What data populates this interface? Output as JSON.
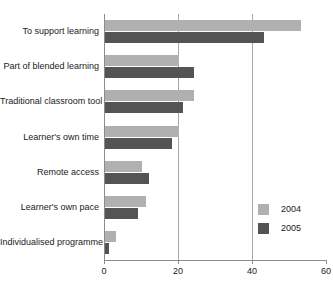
{
  "chart_data": {
    "type": "bar",
    "orientation": "horizontal",
    "title": "",
    "xlabel": "",
    "ylabel": "",
    "xlim": [
      0,
      60
    ],
    "xticks": [
      0,
      20,
      40,
      60
    ],
    "xtick_labels": [
      "0",
      "20",
      "40",
      "60"
    ],
    "grid": "vertical",
    "legend_position": "bottom-right-inside",
    "categories": [
      "To support learning",
      "Part of blended learning",
      "Traditional classroom tool",
      "Learner's own time",
      "Remote access",
      "Learner's own pace",
      "Individualised programme"
    ],
    "series": [
      {
        "name": "2004",
        "color": "#b0b0b0",
        "values": [
          53,
          20,
          24,
          20,
          10,
          11,
          3
        ]
      },
      {
        "name": "2005",
        "color": "#545454",
        "values": [
          43,
          24,
          21,
          18,
          12,
          9,
          1
        ]
      }
    ]
  },
  "legend": {
    "entries": [
      {
        "label": "2004",
        "color": "#b0b0b0"
      },
      {
        "label": "2005",
        "color": "#545454"
      }
    ]
  },
  "colors": {
    "series_2004": "#b0b0b0",
    "series_2005": "#545454",
    "axis": "#8c8c8c",
    "gridline": "#a8a8a8",
    "text": "#1a1a1a",
    "background": "#ffffff"
  }
}
